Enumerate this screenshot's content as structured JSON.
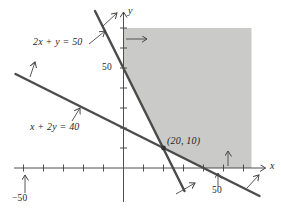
{
  "figure": {
    "width": 281,
    "height": 213,
    "background": "#ffffff"
  },
  "chart_data": {
    "type": "line",
    "title": "",
    "axes": {
      "x_label": "x",
      "y_label": "y",
      "x_range": [
        -54.75,
        71
      ],
      "y_range": [
        -17,
        78
      ],
      "x_tick_step": 10,
      "y_tick_step": 10,
      "axis_color": "#3c3c3c"
    },
    "origin_px": [
      123.5,
      168
    ],
    "px_per_unit": 2,
    "x_ticks": [
      -50,
      -40,
      -30,
      -20,
      -10,
      10,
      20,
      30,
      40,
      50,
      60
    ],
    "y_ticks": [
      10,
      20,
      30,
      40,
      50,
      60,
      70
    ],
    "tick_labels": {
      "y50": "50",
      "x50": "50",
      "xneg50": "−50"
    },
    "lines": [
      {
        "name": "constraint-1",
        "equation": "2x + y = 50",
        "endpoints": [
          [
            -14.25,
            78.5
          ],
          [
            30.5,
            -11.5
          ]
        ],
        "color": "#4b4b4b",
        "stroke_width": 2.4
      },
      {
        "name": "constraint-2",
        "equation": "x + 2y = 40",
        "endpoints": [
          [
            -54,
            47
          ],
          [
            68,
            -14
          ]
        ],
        "color": "#4b4b4b",
        "stroke_width": 2.4
      }
    ],
    "region": {
      "name": "feasible-region",
      "fill": "#cacac9",
      "vertices": [
        [
          0,
          70
        ],
        [
          64,
          70
        ],
        [
          64,
          0
        ],
        [
          40,
          0
        ],
        [
          20,
          10
        ],
        [
          0,
          50
        ]
      ]
    },
    "point": {
      "coords": [
        20,
        10
      ],
      "label": "(20, 10)",
      "color": "#333333",
      "radius_px": 2.4
    },
    "annotation_arrows_px": [
      {
        "name": "label-arrow-eq1",
        "from": [
          89,
          44
        ],
        "to": [
          105,
          31
        ]
      },
      {
        "name": "label-arrow-eq2",
        "from": [
          72,
          121
        ],
        "to": [
          80,
          108
        ]
      },
      {
        "name": "label-arrow-neg50",
        "from": [
          25,
          193
        ],
        "to": [
          25,
          175
        ]
      },
      {
        "name": "label-arrow-50",
        "from": [
          218,
          187
        ],
        "to": [
          218,
          173
        ]
      },
      {
        "name": "halfplane-arrow-line1-top",
        "from": [
          103,
          26
        ],
        "to": [
          117,
          13
        ]
      },
      {
        "name": "halfplane-arrow-line1-bottom",
        "from": [
          176,
          194
        ],
        "to": [
          195,
          183
        ]
      },
      {
        "name": "halfplane-arrow-line2-left",
        "from": [
          30,
          77
        ],
        "to": [
          35,
          62
        ]
      },
      {
        "name": "halfplane-arrow-line2-right",
        "from": [
          247,
          188
        ],
        "to": [
          259,
          175
        ]
      },
      {
        "name": "halfplane-arrow-x-nonneg",
        "from": [
          126,
          39
        ],
        "to": [
          147,
          39
        ]
      },
      {
        "name": "halfplane-arrow-y-nonneg",
        "from": [
          228,
          166
        ],
        "to": [
          228,
          151
        ]
      }
    ],
    "annotation_color": "#464646"
  }
}
